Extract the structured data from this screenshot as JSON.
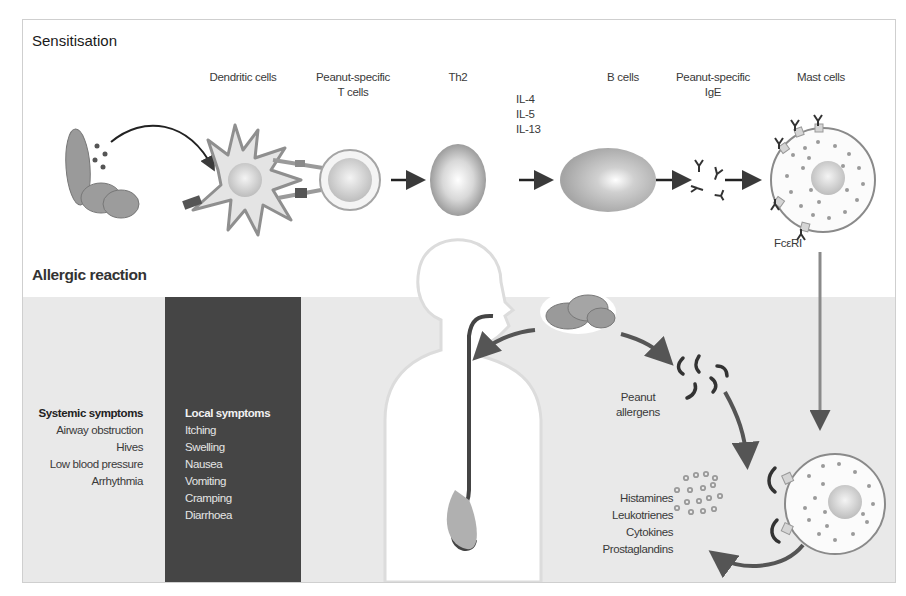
{
  "sensitisation": {
    "title": "Sensitisation",
    "labels": {
      "dendritic_cells": "Dendritic cells",
      "peanut_specific_t_line1": "Peanut-specific",
      "peanut_specific_t_line2": "T cells",
      "th2": "Th2",
      "cytokines": [
        "IL-4",
        "IL-5",
        "IL-13"
      ],
      "b_cells": "B cells",
      "peanut_specific_ige_line1": "Peanut-specific",
      "peanut_specific_ige_line2": "IgE",
      "mast_cells": "Mast cells",
      "receptor": "FcεRI"
    }
  },
  "allergic_reaction": {
    "title": "Allergic reaction",
    "systemic_symptoms": {
      "heading": "Systemic symptoms",
      "items": [
        "Airway obstruction",
        "Hives",
        "Low blood pressure",
        "Arrhythmia"
      ]
    },
    "local_symptoms": {
      "heading": "Local symptoms",
      "items": [
        "Itching",
        "Swelling",
        "Nausea",
        "Vomiting",
        "Cramping",
        "Diarrhoea"
      ]
    },
    "peanut_allergens_line1": "Peanut",
    "peanut_allergens_line2": "allergens",
    "mediators": [
      "Histamines",
      "Leukotrienes",
      "Cytokines",
      "Prostaglandins"
    ]
  },
  "colors": {
    "band": "#e9e9e9",
    "dark_column": "#454545",
    "arrow": "#4a4a4a",
    "cell_grey": "#a8a8a8"
  }
}
